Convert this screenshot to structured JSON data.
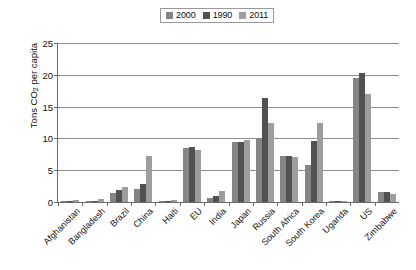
{
  "chart_data": {
    "type": "bar",
    "title": "",
    "xlabel": "",
    "ylabel": "Tons CO2 per capita",
    "ylabel_main": "Tons CO",
    "ylabel_sub": "2",
    "ylabel_tail": " per capita",
    "ylim": [
      0,
      25
    ],
    "yticks": [
      0,
      5,
      10,
      15,
      20,
      25
    ],
    "grid": true,
    "legend_position": "top-center",
    "categories": [
      "Afghanistan",
      "Bangladesh",
      "Brazil",
      "China",
      "Haiti",
      "EU",
      "India",
      "Japan",
      "Russia",
      "South Africa",
      "South Korea",
      "Uganda",
      "US",
      "Zimbabwe"
    ],
    "series": [
      {
        "name": "2000",
        "color": "#858585",
        "values": [
          0.1,
          0.2,
          1.4,
          2.1,
          0.2,
          8.5,
          0.7,
          9.5,
          10.0,
          7.3,
          5.8,
          0.1,
          19.5,
          1.5
        ]
      },
      {
        "name": "1990",
        "color": "#515151",
        "values": [
          0.2,
          0.15,
          1.9,
          2.8,
          0.2,
          8.6,
          1.0,
          9.5,
          16.3,
          7.3,
          9.6,
          0.1,
          20.3,
          1.5
        ]
      },
      {
        "name": "2011",
        "color": "#9d9d9d",
        "values": [
          0.3,
          0.4,
          2.3,
          7.2,
          0.25,
          8.1,
          1.7,
          9.8,
          12.5,
          7.0,
          12.4,
          0.1,
          17.0,
          1.2
        ]
      }
    ]
  },
  "legend": {
    "entries": [
      {
        "label": "2000"
      },
      {
        "label": "1990"
      },
      {
        "label": "2011"
      }
    ]
  }
}
